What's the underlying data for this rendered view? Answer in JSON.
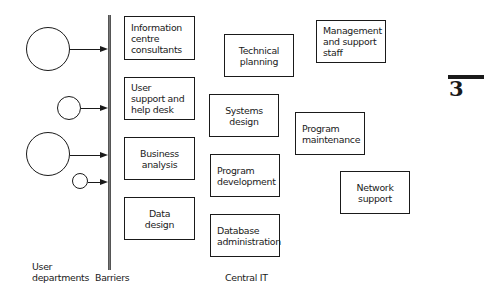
{
  "diagram": {
    "user_departments": {
      "label_line1": "User",
      "label_line2": "departments",
      "circles": [
        {
          "id": "dept-1",
          "size": "large"
        },
        {
          "id": "dept-2",
          "size": "medium"
        },
        {
          "id": "dept-3",
          "size": "large"
        },
        {
          "id": "dept-4",
          "size": "small"
        }
      ]
    },
    "barriers": {
      "label": "Barriers"
    },
    "boundary_functions": [
      {
        "lines": [
          "Information",
          "centre",
          "consultants"
        ]
      },
      {
        "lines": [
          "User",
          "support and",
          "help desk"
        ]
      },
      {
        "lines": [
          "Business",
          "analysis"
        ]
      },
      {
        "lines": [
          "Data",
          "design"
        ]
      }
    ],
    "central_it": {
      "label": "Central IT",
      "functions": [
        {
          "lines": [
            "Technical",
            "planning"
          ]
        },
        {
          "lines": [
            "Management",
            "and support",
            "staff"
          ]
        },
        {
          "lines": [
            "Systems",
            "design"
          ]
        },
        {
          "lines": [
            "Program",
            "maintenance"
          ]
        },
        {
          "lines": [
            "Program",
            "development"
          ]
        },
        {
          "lines": [
            "Network",
            "support"
          ]
        },
        {
          "lines": [
            "Database",
            "administration"
          ]
        }
      ]
    },
    "chapter_marker": "3"
  }
}
